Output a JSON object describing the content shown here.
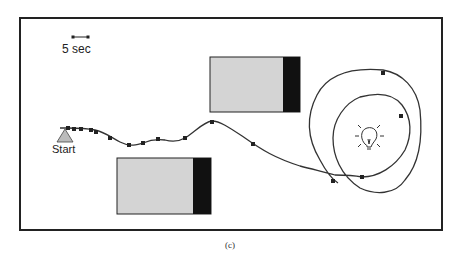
{
  "figure": {
    "caption": "(c)",
    "scale_bar_label": "5 sec",
    "start_label": "Start",
    "colors": {
      "frame": "#222222",
      "path": "#333333",
      "marker": "#222222",
      "obstacle_fill": "#d4d4d4",
      "obstacle_dark": "#111111",
      "start_triangle": "#bbbbbb"
    },
    "obstacles": [
      {
        "name": "obstacle-top",
        "x": 210,
        "y": 57,
        "w": 90,
        "h": 55,
        "dark_w": 17
      },
      {
        "name": "obstacle-bottom",
        "x": 117,
        "y": 158,
        "w": 94,
        "h": 56,
        "dark_w": 18
      }
    ],
    "goal_icon": "lightbulb-icon"
  }
}
